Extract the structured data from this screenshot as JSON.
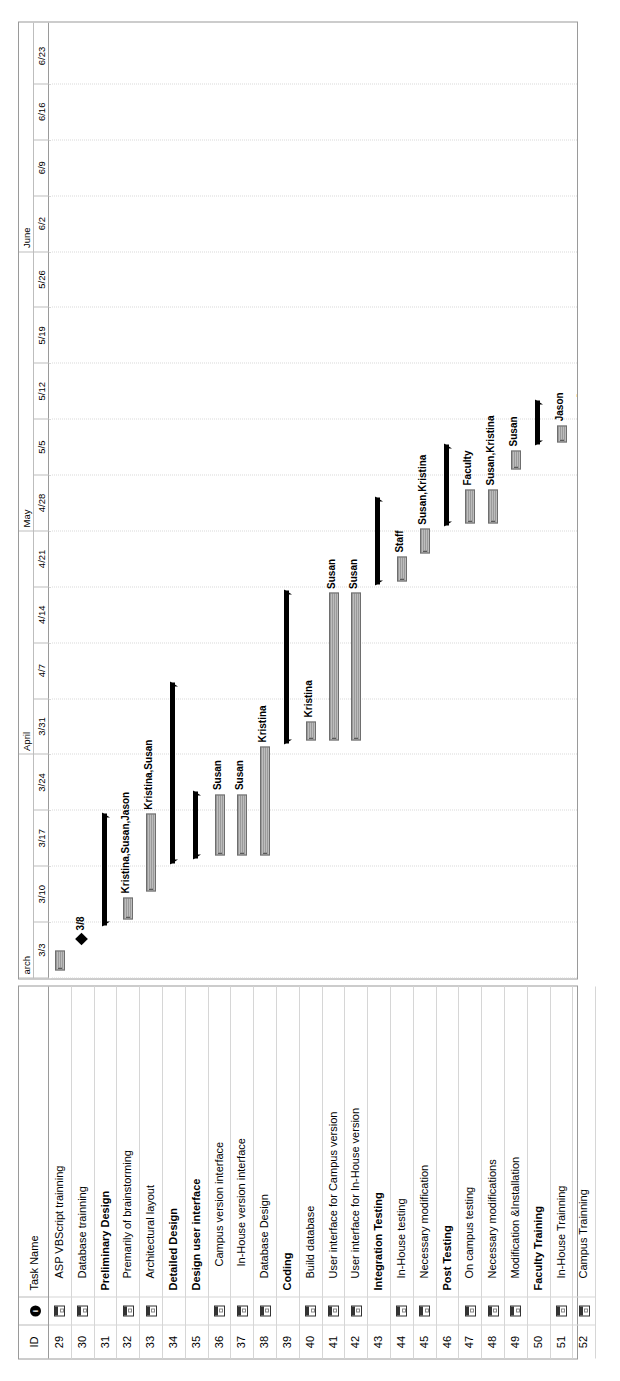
{
  "table": {
    "columns": {
      "id": "ID",
      "indicator": "i",
      "name": "Task Name"
    },
    "rows": [
      {
        "id": "29",
        "name": "ASP VBScript trainning",
        "level": 1,
        "note": true
      },
      {
        "id": "30",
        "name": "Database trainning",
        "level": 1,
        "note": true
      },
      {
        "id": "31",
        "name": "Preliminary Design",
        "level": 0,
        "note": false
      },
      {
        "id": "32",
        "name": "Premarily of brainstorming",
        "level": 1,
        "note": true
      },
      {
        "id": "33",
        "name": "Architectural layout",
        "level": 1,
        "note": true
      },
      {
        "id": "34",
        "name": "Detailed Design",
        "level": 0,
        "note": false
      },
      {
        "id": "35",
        "name": "Design user interface",
        "level": 0,
        "note": false
      },
      {
        "id": "36",
        "name": "Campus version interface",
        "level": 2,
        "note": true
      },
      {
        "id": "37",
        "name": "In-House version interface",
        "level": 2,
        "note": true
      },
      {
        "id": "38",
        "name": "Database Design",
        "level": 1,
        "note": true
      },
      {
        "id": "39",
        "name": "Coding",
        "level": 0,
        "note": false
      },
      {
        "id": "40",
        "name": "Build database",
        "level": 1,
        "note": true
      },
      {
        "id": "41",
        "name": "User interface for Campus version",
        "level": 1,
        "note": true
      },
      {
        "id": "42",
        "name": "User interface for In-House version",
        "level": 1,
        "note": true
      },
      {
        "id": "43",
        "name": "Integration Testing",
        "level": 0,
        "note": false
      },
      {
        "id": "44",
        "name": "In-House testing",
        "level": 1,
        "note": true
      },
      {
        "id": "45",
        "name": "Necessary modification",
        "level": 1,
        "note": true
      },
      {
        "id": "46",
        "name": "Post Testing",
        "level": 0,
        "note": false
      },
      {
        "id": "47",
        "name": "On campus testing",
        "level": 1,
        "note": true
      },
      {
        "id": "48",
        "name": "Necessary modifications",
        "level": 1,
        "note": true
      },
      {
        "id": "49",
        "name": "Modification &Installation",
        "level": 1,
        "note": true
      },
      {
        "id": "50",
        "name": "Faculty Training",
        "level": 0,
        "note": false
      },
      {
        "id": "51",
        "name": "In-House Trainning",
        "level": 1,
        "note": true
      },
      {
        "id": "52",
        "name": "Campus Trainning",
        "level": 1,
        "note": true
      }
    ]
  },
  "timeline": {
    "months": [
      {
        "label": "arch",
        "start_week": 0,
        "weeks": 4
      },
      {
        "label": "April",
        "start_week": 4,
        "weeks": 4
      },
      {
        "label": "May",
        "start_week": 8,
        "weeks": 5
      },
      {
        "label": "June",
        "start_week": 13,
        "weeks": 4
      }
    ],
    "weeks": [
      "3/3",
      "3/10",
      "3/17",
      "3/24",
      "3/31",
      "4/7",
      "4/14",
      "4/21",
      "4/28",
      "5/5",
      "5/12",
      "5/19",
      "5/26",
      "6/2",
      "6/9",
      "6/16",
      "6/23"
    ]
  },
  "chart_data": {
    "type": "gantt",
    "xlabel": "",
    "ylabel": "",
    "axis_start": "3/3",
    "axis_end": "6/23",
    "week_count": 17,
    "grid": true,
    "tasks": [
      {
        "id": "29",
        "name": "ASP VBScript trainning",
        "kind": "task",
        "start_week": 0.15,
        "end_week": 0.5,
        "label": "",
        "label_bold": false
      },
      {
        "id": "30",
        "name": "Database trainning",
        "kind": "milestone",
        "start_week": 0.7,
        "end_week": 0.7,
        "label": "3/8",
        "label_bold": true
      },
      {
        "id": "31",
        "name": "Preliminary Design",
        "kind": "summary",
        "start_week": 0.95,
        "end_week": 2.95,
        "label": "",
        "label_bold": false
      },
      {
        "id": "32",
        "name": "Premarily of brainstorming",
        "kind": "task",
        "start_week": 1.05,
        "end_week": 1.45,
        "label": "Kristina,Susan,Jason",
        "label_bold": true
      },
      {
        "id": "33",
        "name": "Architectural layout",
        "kind": "task",
        "start_week": 1.55,
        "end_week": 2.95,
        "label": "Kristina,Susan",
        "label_bold": true
      },
      {
        "id": "34",
        "name": "Detailed Design",
        "kind": "summary",
        "start_week": 2.05,
        "end_week": 5.3,
        "label": "",
        "label_bold": false
      },
      {
        "id": "35",
        "name": "Design user interface",
        "kind": "summary",
        "start_week": 2.15,
        "end_week": 3.35,
        "label": "",
        "label_bold": false
      },
      {
        "id": "36",
        "name": "Campus version interface",
        "kind": "task",
        "start_week": 2.2,
        "end_week": 3.3,
        "label": "Susan",
        "label_bold": true
      },
      {
        "id": "37",
        "name": "In-House version interface",
        "kind": "task",
        "start_week": 2.2,
        "end_week": 3.3,
        "label": "Susan",
        "label_bold": true
      },
      {
        "id": "38",
        "name": "Database Design",
        "kind": "task",
        "start_week": 2.2,
        "end_week": 4.15,
        "label": "Kristina",
        "label_bold": true
      },
      {
        "id": "39",
        "name": "Coding",
        "kind": "summary",
        "start_week": 4.2,
        "end_week": 6.95,
        "label": "",
        "label_bold": false
      },
      {
        "id": "40",
        "name": "Build database",
        "kind": "task",
        "start_week": 4.25,
        "end_week": 4.6,
        "label": "Kristina",
        "label_bold": true
      },
      {
        "id": "41",
        "name": "User interface for Campus version",
        "kind": "task",
        "start_week": 4.25,
        "end_week": 6.9,
        "label": "Susan",
        "label_bold": true
      },
      {
        "id": "42",
        "name": "User interface for In-House version",
        "kind": "task",
        "start_week": 4.25,
        "end_week": 6.9,
        "label": "Susan",
        "label_bold": true
      },
      {
        "id": "43",
        "name": "Integration Testing",
        "kind": "summary",
        "start_week": 7.05,
        "end_week": 8.6,
        "label": "",
        "label_bold": false
      },
      {
        "id": "44",
        "name": "In-House testing",
        "kind": "task",
        "start_week": 7.1,
        "end_week": 7.55,
        "label": "Staff",
        "label_bold": true
      },
      {
        "id": "45",
        "name": "Necessary modification",
        "kind": "task",
        "start_week": 7.6,
        "end_week": 8.05,
        "label": "Susan,Kristina",
        "label_bold": true
      },
      {
        "id": "46",
        "name": "Post Testing",
        "kind": "summary",
        "start_week": 8.1,
        "end_week": 9.55,
        "label": "",
        "label_bold": false
      },
      {
        "id": "47",
        "name": "On campus testing",
        "kind": "task",
        "start_week": 8.15,
        "end_week": 8.75,
        "label": "Faculty",
        "label_bold": true
      },
      {
        "id": "48",
        "name": "Necessary modifications",
        "kind": "task",
        "start_week": 8.15,
        "end_week": 8.75,
        "label": "Susan,Kristina",
        "label_bold": true
      },
      {
        "id": "49",
        "name": "Modification &Installation",
        "kind": "task",
        "start_week": 9.1,
        "end_week": 9.45,
        "label": "Susan",
        "label_bold": true
      },
      {
        "id": "50",
        "name": "Faculty Training",
        "kind": "summary",
        "start_week": 9.55,
        "end_week": 10.35,
        "label": "",
        "label_bold": false
      },
      {
        "id": "51",
        "name": "In-House Trainning",
        "kind": "task",
        "start_week": 9.6,
        "end_week": 9.9,
        "label": "Jason",
        "label_bold": true
      },
      {
        "id": "52",
        "name": "Campus Trainning",
        "kind": "task",
        "start_week": 10.0,
        "end_week": 10.3,
        "label": "Jason",
        "label_bold": true
      }
    ]
  }
}
